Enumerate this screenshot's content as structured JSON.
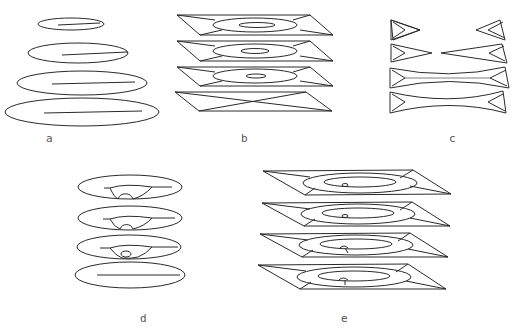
{
  "figure": {
    "panels": [
      {
        "id": "a",
        "label": "a",
        "description": "Four stacked ellipses with horizontal center line, increasing size top to bottom"
      },
      {
        "id": "b",
        "label": "b",
        "description": "Four stacked parallelogram slabs with nested ellipses; bottom slab shows crossing diagonals"
      },
      {
        "id": "c",
        "label": "c",
        "description": "Four stacked slabs; top two split into separated triangular wedges, bottom two connected with curved waist"
      },
      {
        "id": "d",
        "label": "d",
        "description": "Four stacked ellipses with semicircular notch feature shrinking downward; bottom shows plain center line"
      },
      {
        "id": "e",
        "label": "e",
        "description": "Four stacked parallelogram slabs with nested ellipses and small central defect"
      }
    ]
  },
  "colors": {
    "stroke": "#2a2a2a",
    "background": "#ffffff",
    "label": "#555555"
  }
}
